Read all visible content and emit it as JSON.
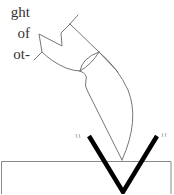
{
  "text_fragment": {
    "lines": [
      "ght",
      "of",
      "ot-"
    ]
  },
  "figure": {
    "colors": {
      "thin_line": "#555555",
      "bold_v": "#000000",
      "surface": "#777777"
    },
    "annotations": {
      "left_ticks": "”",
      "right_ticks": "”"
    }
  }
}
